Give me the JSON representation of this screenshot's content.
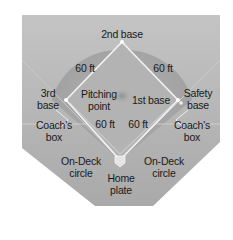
{
  "diagram": {
    "type": "softball-field-layout",
    "colors": {
      "background": "#b8b8b8",
      "infield": "#a6a6a6",
      "lines": "#f2f2f2",
      "text": "#1a1a1a"
    },
    "bases": {
      "second": "2nd base",
      "first": "1st base",
      "third_line1": "3rd",
      "third_line2": "base",
      "safety_line1": "Safety",
      "safety_line2": "base",
      "home_line1": "Home",
      "home_line2": "plate"
    },
    "pitching_point": {
      "line1": "Pitching",
      "line2": "point"
    },
    "distances": {
      "second_to_third": "60 ft",
      "second_to_first": "60 ft",
      "third_to_home": "60 ft",
      "first_to_home": "60 ft"
    },
    "coach_box_left": {
      "line1": "Coach's",
      "line2": "box"
    },
    "coach_box_right": {
      "line1": "Coach's",
      "line2": "box"
    },
    "on_deck_left": {
      "line1": "On-Deck",
      "line2": "circle"
    },
    "on_deck_right": {
      "line1": "On-Deck",
      "line2": "circle"
    }
  }
}
